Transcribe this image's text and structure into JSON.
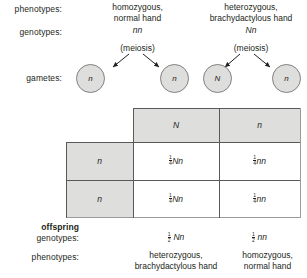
{
  "diagram": {
    "row_labels": {
      "phenotypes": "phenotypes:",
      "genotypes": "genotypes:",
      "gametes": "gametes:",
      "offspring": "offspring",
      "offspring_genotypes": "genotypes:",
      "offspring_phenotypes": "phenotypes:"
    },
    "parents": [
      {
        "phenotype_line1": "homozygous,",
        "phenotype_line2": "normal hand",
        "genotype": "nn",
        "meiosis": "(meiosis)",
        "gametes": [
          "n",
          "n"
        ]
      },
      {
        "phenotype_line1": "heterozygous,",
        "phenotype_line2": "brachydactylous hand",
        "genotype": "Nn",
        "meiosis": "(meiosis)",
        "gametes": [
          "N",
          "n"
        ]
      }
    ],
    "punnett": {
      "column_headers": [
        "N",
        "n"
      ],
      "row_headers": [
        "n",
        "n"
      ],
      "cells": [
        [
          {
            "numerator": "1",
            "denominator": "4",
            "genotype": "Nn"
          },
          {
            "numerator": "1",
            "denominator": "4",
            "genotype": "nn"
          }
        ],
        [
          {
            "numerator": "1",
            "denominator": "4",
            "genotype": "Nn"
          },
          {
            "numerator": "1",
            "denominator": "4",
            "genotype": "nn"
          }
        ]
      ]
    },
    "offspring": [
      {
        "numerator": "1",
        "denominator": "2",
        "genotype": "Nn",
        "phenotype_line1": "heterozygous,",
        "phenotype_line2": "brachydactylous hand"
      },
      {
        "numerator": "1",
        "denominator": "2",
        "genotype": "nn",
        "phenotype_line1": "homozygous,",
        "phenotype_line2": "normal hand"
      }
    ],
    "colors": {
      "shade": "#dededd",
      "line": "#595959",
      "text": "#231f20"
    }
  }
}
